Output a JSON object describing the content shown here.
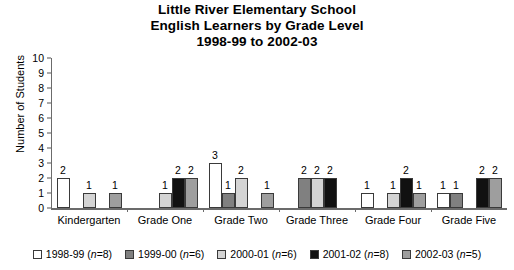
{
  "chart_data": {
    "type": "bar",
    "title": "Little River Elementary School English Learners by Grade Level 1998-99 to 2002-03",
    "title_lines": [
      "Little River Elementary School",
      "English Learners by Grade Level",
      "1998-99 to 2002-03"
    ],
    "xlabel": "",
    "ylabel": "Number of Students",
    "ylim": [
      0,
      10
    ],
    "yticks": [
      0,
      1,
      2,
      3,
      4,
      5,
      6,
      7,
      8,
      9,
      10
    ],
    "grid": false,
    "legend_position": "bottom",
    "categories": [
      "Kindergarten",
      "Grade One",
      "Grade Two",
      "Grade Three",
      "Grade Four",
      "Grade Five"
    ],
    "series": [
      {
        "name": "1998-99",
        "legend_label": "1998-99 (n=8)",
        "n": 8,
        "color": "#ffffff",
        "values": [
          2,
          null,
          3,
          null,
          1,
          1
        ]
      },
      {
        "name": "1999-00",
        "legend_label": "1999-00 (n=6)",
        "n": 6,
        "color": "#808080",
        "values": [
          null,
          null,
          1,
          2,
          null,
          1
        ]
      },
      {
        "name": "2000-01",
        "legend_label": "2000-01 (n=6)",
        "n": 6,
        "color": "#d4d4d4",
        "values": [
          1,
          1,
          2,
          2,
          1,
          null
        ]
      },
      {
        "name": "2001-02",
        "legend_label": "2001-02 (n=8)",
        "n": 8,
        "color": "#111111",
        "values": [
          null,
          2,
          null,
          2,
          2,
          2
        ]
      },
      {
        "name": "2002-03",
        "legend_label": "2002-03 (n=5)",
        "n": 5,
        "color": "#9e9e9e",
        "values": [
          1,
          2,
          1,
          null,
          1,
          2
        ]
      }
    ]
  }
}
